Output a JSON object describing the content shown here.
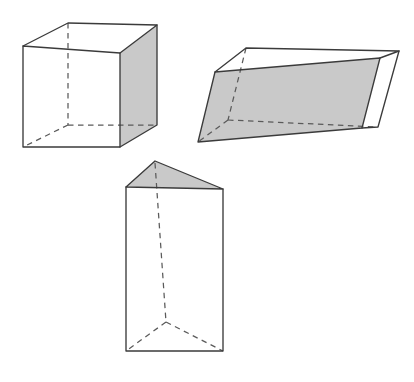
{
  "figure": {
    "title": "Three geometric solids",
    "canvas": {
      "width": 414,
      "height": 382,
      "background": "#ffffff"
    },
    "style": {
      "solid_edge_color": "#3b3b3b",
      "hidden_edge_color": "#5a5a5a",
      "shaded_face_color": "#c9c9c9",
      "white_face_color": "#ffffff",
      "hidden_edge_dash": "5.5 4.5",
      "solid_edge_width": 1.35,
      "hidden_edge_width": 1.25
    },
    "shapes": [
      {
        "id": "cube",
        "name": "cube",
        "label": "Cube",
        "shaded_face": "right",
        "vertices": {
          "front_top_left": [
            23,
            46
          ],
          "front_top_right": [
            120,
            53
          ],
          "front_bottom_left": [
            23,
            147
          ],
          "front_bottom_right": [
            120,
            147
          ],
          "back_top_left": [
            68,
            23
          ],
          "back_top_right": [
            157,
            25
          ],
          "back_bottom_left": [
            68,
            125
          ],
          "back_bottom_right": [
            157,
            125
          ]
        },
        "shaded_face_polygon": "120,53 157,25 157,125 120,147",
        "front_face_polygon": "23,46 120,53 120,147 23,147",
        "top_face_polygon": "23,46 68,23 157,25 120,53",
        "solid_edges": [
          "23,46 120,53",
          "120,53 120,147",
          "120,147 23,147",
          "23,147 23,46",
          "23,46 68,23",
          "68,23 157,25",
          "157,25 120,53",
          "157,25 157,125",
          "157,125 120,147"
        ],
        "hidden_edges": [
          "68,23 68,125",
          "68,125 23,147",
          "68,125 157,125"
        ]
      },
      {
        "id": "parallelepiped",
        "name": "oblique-parallelepiped",
        "label": "Oblique parallelepiped",
        "shaded_face": "left",
        "vertices": {
          "front_top_left": [
            215,
            72
          ],
          "front_top_right": [
            399,
            51
          ],
          "front_bottom_left": [
            198,
            142
          ],
          "front_bottom_right": [
            378,
            127
          ],
          "back_top_left": [
            246,
            48
          ],
          "back_top_right": [
            399,
            51
          ],
          "back_bottom_left": [
            228,
            120
          ],
          "back_bottom_right": [
            378,
            127
          ]
        },
        "shaded_face_polygon": "215,72 380,58 362,128 198,142",
        "top_face_polygon": "215,72 246,48 399,51 380,58",
        "right_face_polygon": "380,58 399,51 378,127 362,128",
        "solid_edges": [
          "215,72 380,58",
          "380,58 362,128",
          "362,128 198,142",
          "198,142 215,72",
          "215,72 246,48",
          "246,48 399,51",
          "399,51 380,58",
          "399,51 378,127",
          "378,127 362,128"
        ],
        "hidden_edges": [
          "246,48 228,120",
          "228,120 198,142",
          "228,120 378,127"
        ]
      },
      {
        "id": "triangular-prism",
        "name": "triangular-prism",
        "label": "Triangular prism",
        "shaded_face": "top",
        "vertices": {
          "apex_front": [
            155,
            161
          ],
          "top_front_left": [
            126,
            187
          ],
          "top_front_right": [
            223,
            189
          ],
          "apex_back": [
            155,
            161
          ],
          "top_back": [
            168,
            176
          ],
          "bottom_front_left": [
            126,
            351
          ],
          "bottom_front_right": [
            223,
            351
          ],
          "bottom_back": [
            168,
            322
          ]
        },
        "shaded_face_polygon": "155,161 223,189 126,187",
        "front_face_polygon": "126,187 223,189 223,351 126,351",
        "solid_edges": [
          "126,187 155,161",
          "155,161 223,189",
          "126,187 223,189",
          "126,187 126,351",
          "223,189 223,351",
          "126,351 223,351"
        ],
        "hidden_edges": [
          "155,161 155,322",
          "168,322 126,351",
          "168,322 223,351",
          "155,322 168,322"
        ]
      }
    ]
  }
}
